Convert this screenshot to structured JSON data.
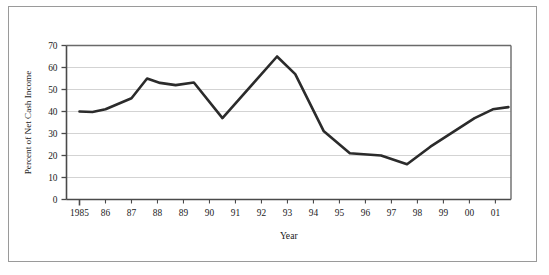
{
  "chart_data": {
    "type": "line",
    "title": "",
    "xlabel": "Year",
    "ylabel": "Percent of Net Cash Income",
    "xlim": [
      1984.5,
      2001.6
    ],
    "ylim": [
      0,
      70
    ],
    "ytick_values": [
      0,
      10,
      20,
      30,
      40,
      50,
      60,
      70
    ],
    "ytick_labels": [
      "0",
      "10",
      "20",
      "30",
      "40",
      "50",
      "60",
      "70"
    ],
    "categories": [
      "1985",
      "86",
      "87",
      "88",
      "89",
      "90",
      "91",
      "92",
      "93",
      "94",
      "95",
      "96",
      "97",
      "98",
      "99",
      "00",
      "01"
    ],
    "x": [
      1985,
      1986,
      1987,
      1988,
      1989,
      1990,
      1991,
      1992,
      1993,
      1994,
      1995,
      1996,
      1997,
      1998,
      1999,
      2000,
      2001
    ],
    "values": [
      40,
      42,
      55,
      52,
      53,
      48,
      37,
      52,
      65,
      50,
      31,
      21,
      20,
      18,
      22,
      31,
      38
    ],
    "peak_x": 1992.6,
    "peak_value": 65,
    "trough_x": 1997.6,
    "trough_value": 16,
    "end_value": 42,
    "grid": true,
    "gridline_color": "#c8c8c8",
    "line_color": "#2b2b2b",
    "line_width": 2.6,
    "axis_color": "#555555",
    "legend": "none",
    "legend_position": "none",
    "series": [
      {
        "name": "Percent of Net Cash Income",
        "points": [
          {
            "x": 1985.0,
            "y": 40
          },
          {
            "x": 1985.5,
            "y": 39.8
          },
          {
            "x": 1986.0,
            "y": 41
          },
          {
            "x": 1987.0,
            "y": 46
          },
          {
            "x": 1987.6,
            "y": 55
          },
          {
            "x": 1988.1,
            "y": 53
          },
          {
            "x": 1988.7,
            "y": 52
          },
          {
            "x": 1989.4,
            "y": 53.2
          },
          {
            "x": 1990.5,
            "y": 37
          },
          {
            "x": 1992.6,
            "y": 65
          },
          {
            "x": 1993.3,
            "y": 57
          },
          {
            "x": 1994.4,
            "y": 31
          },
          {
            "x": 1995.4,
            "y": 21
          },
          {
            "x": 1996.6,
            "y": 20
          },
          {
            "x": 1997.6,
            "y": 16
          },
          {
            "x": 1998.5,
            "y": 24
          },
          {
            "x": 2000.2,
            "y": 37
          },
          {
            "x": 2000.9,
            "y": 41
          },
          {
            "x": 2001.5,
            "y": 42
          }
        ]
      }
    ]
  },
  "axes": {
    "x_title": "Year",
    "y_title": "Percent of Net Cash Income"
  }
}
